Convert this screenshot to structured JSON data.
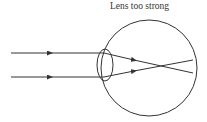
{
  "diagram": {
    "title": "Lens too strong",
    "type": "eye-ray-diagram",
    "condition": "myopia",
    "elements": {
      "eyeball": {
        "shape": "circle"
      },
      "lens": {
        "shape": "biconvex-ellipse"
      },
      "rays": [
        {
          "label": "upper incoming ray",
          "direction": "left-to-right"
        },
        {
          "label": "lower incoming ray",
          "direction": "left-to-right"
        }
      ],
      "focal_point": "in front of retina"
    },
    "colors": {
      "stroke": "#333333",
      "background": "#ffffff"
    }
  }
}
